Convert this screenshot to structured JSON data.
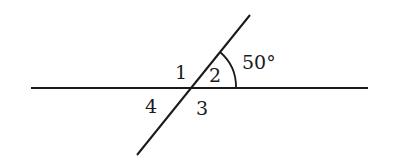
{
  "diagram": {
    "type": "intersecting-lines-angles",
    "angle_labels": [
      "1",
      "2",
      "3",
      "4"
    ],
    "given_angle": "50°",
    "line_color": "#1a1a1a",
    "background": "#ffffff"
  }
}
